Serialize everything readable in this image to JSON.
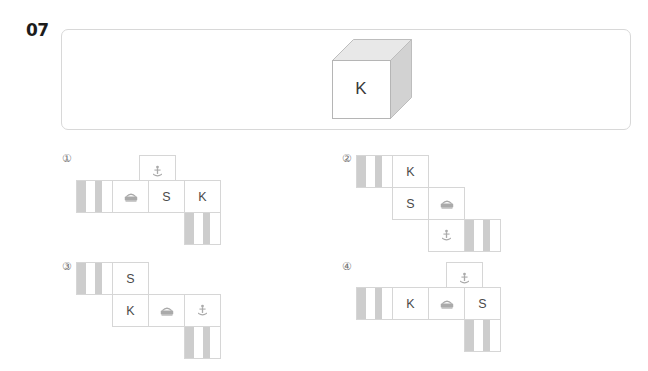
{
  "question": {
    "number": "07"
  },
  "prompt": {
    "cube": {
      "front_label": "K",
      "top_face_color": "#e3e3e3",
      "right_face_color": "#cfcfcf",
      "front_face_color": "#ffffff"
    }
  },
  "options": [
    {
      "label": "①",
      "cells": [
        {
          "type": "striped",
          "text": ""
        },
        {
          "type": "icon",
          "text": "",
          "icon": "telephone-icon"
        },
        {
          "type": "letter",
          "text": "S"
        },
        {
          "type": "letter",
          "text": "K"
        },
        {
          "type": "icon",
          "text": "",
          "icon": "anchor-icon"
        },
        {
          "type": "striped",
          "text": ""
        }
      ]
    },
    {
      "label": "②",
      "cells": [
        {
          "type": "striped",
          "text": ""
        },
        {
          "type": "letter",
          "text": "K"
        },
        {
          "type": "letter",
          "text": "S"
        },
        {
          "type": "icon",
          "text": "",
          "icon": "telephone-icon"
        },
        {
          "type": "icon",
          "text": "",
          "icon": "anchor-icon"
        },
        {
          "type": "striped",
          "text": ""
        }
      ]
    },
    {
      "label": "③",
      "cells": [
        {
          "type": "striped",
          "text": ""
        },
        {
          "type": "letter",
          "text": "S"
        },
        {
          "type": "letter",
          "text": "K"
        },
        {
          "type": "icon",
          "text": "",
          "icon": "telephone-icon"
        },
        {
          "type": "icon",
          "text": "",
          "icon": "anchor-icon"
        },
        {
          "type": "striped",
          "text": ""
        }
      ]
    },
    {
      "label": "④",
      "cells": [
        {
          "type": "icon",
          "text": "",
          "icon": "anchor-icon"
        },
        {
          "type": "striped",
          "text": ""
        },
        {
          "type": "letter",
          "text": "K"
        },
        {
          "type": "icon",
          "text": "",
          "icon": "telephone-icon"
        },
        {
          "type": "letter",
          "text": "S"
        },
        {
          "type": "striped",
          "text": ""
        }
      ]
    }
  ],
  "colors": {
    "stripe": "#cdcdcd",
    "cell_border": "#d6d6d6",
    "panel_border": "#d8d8d8",
    "text": "#4a4a4a"
  }
}
